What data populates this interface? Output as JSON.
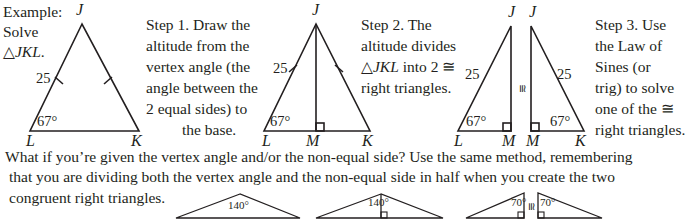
{
  "example": {
    "line1": "Example:",
    "line2": "Solve",
    "line3_symbol": "△",
    "line3_name": "JKL",
    "line3_end": "."
  },
  "step1": {
    "lines": [
      "Step 1. Draw the",
      "altitude from the",
      "vertex angle (the",
      "angle between the",
      "2 equal sides) to",
      "the base."
    ]
  },
  "step2": {
    "line1": "Step 2. The",
    "line2": "altitude divides",
    "line3_symbol": "△",
    "line3_name": "JKL",
    "line3_rest": " into 2 ≅",
    "line4": "right triangles."
  },
  "step3": {
    "lines": [
      "Step 3. Use",
      "the Law of",
      "Sines (or",
      "trig) to solve",
      "one of the ≅",
      "right triangles."
    ]
  },
  "triangle1": {
    "vertices": {
      "top": "J",
      "left": "L",
      "right": "K"
    },
    "side_label": "25",
    "angle_label": "67°"
  },
  "triangle2": {
    "vertices": {
      "top": "J",
      "left": "L",
      "foot": "M",
      "right": "K"
    },
    "side_label": "25",
    "angle_label": "67°"
  },
  "triangle3": {
    "left": {
      "top": "J",
      "left": "L",
      "foot": "M",
      "side_label": "25",
      "angle_label": "67°"
    },
    "congruent_symbol": "≅",
    "right": {
      "top": "J",
      "foot": "M",
      "right": "K",
      "side_label": "25",
      "angle_label": "67°"
    }
  },
  "bottom_text": {
    "line1": "What if you’re given the vertex angle and/or the non-equal side? Use the same method, remembering",
    "line2": "that you are dividing both the vertex angle and the non-equal side in half when you create the two",
    "line3": "congruent right triangles."
  },
  "bottom_figures": {
    "fig1_angle": "140°",
    "fig2_angle": "140°",
    "fig3_left_angle": "70°",
    "fig3_congruent": "≅",
    "fig3_right_angle": "70°"
  }
}
